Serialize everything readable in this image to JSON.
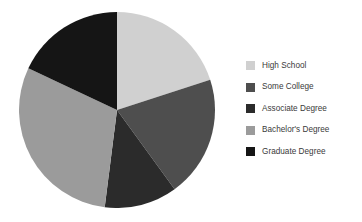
{
  "chart_data": {
    "type": "pie",
    "title": "",
    "subtitle": "",
    "xlabel": "",
    "ylabel": "",
    "grid": false,
    "legend_position": "right",
    "start_angle_deg": 0,
    "direction": "clockwise",
    "center_px": [
      117,
      110
    ],
    "radius_px": 97,
    "labels": [
      "High School",
      "Some College",
      "Associate Degree",
      "Bachelor's Degree",
      "Graduate Degree"
    ],
    "values": [
      20,
      20,
      12,
      30,
      18
    ],
    "percentages": [
      20,
      20,
      12,
      30,
      18
    ],
    "angles_deg": [
      72,
      72,
      43.2,
      108,
      64.8
    ],
    "colors": [
      "#d0d0d0",
      "#4e4e4e",
      "#2b2b2b",
      "#9b9b9b",
      "#151515"
    ],
    "slices": [
      {
        "label": "High School",
        "value": 20,
        "percent": 20,
        "angle_deg": 72,
        "start_deg": 0,
        "end_deg": 72,
        "color": "#d0d0d0"
      },
      {
        "label": "Some College",
        "value": 20,
        "percent": 20,
        "angle_deg": 72,
        "start_deg": 72,
        "end_deg": 144,
        "color": "#4e4e4e"
      },
      {
        "label": "Associate Degree",
        "value": 12,
        "percent": 12,
        "angle_deg": 43.2,
        "start_deg": 144,
        "end_deg": 187.2,
        "color": "#2b2b2b"
      },
      {
        "label": "Bachelor's Degree",
        "value": 30,
        "percent": 30,
        "angle_deg": 108,
        "start_deg": 187.2,
        "end_deg": 295.2,
        "color": "#9b9b9b"
      },
      {
        "label": "Graduate Degree",
        "value": 18,
        "percent": 18,
        "angle_deg": 64.8,
        "start_deg": 295.2,
        "end_deg": 360,
        "color": "#151515"
      }
    ]
  },
  "legend": {
    "items": [
      {
        "label": "High School",
        "color": "#d0d0d0"
      },
      {
        "label": "Some College",
        "color": "#4e4e4e"
      },
      {
        "label": "Associate Degree",
        "color": "#2b2b2b"
      },
      {
        "label": "Bachelor's Degree",
        "color": "#9b9b9b"
      },
      {
        "label": "Graduate Degree",
        "color": "#151515"
      }
    ]
  },
  "canvas": {
    "background": "#ffffff",
    "width": 362,
    "height": 222
  }
}
